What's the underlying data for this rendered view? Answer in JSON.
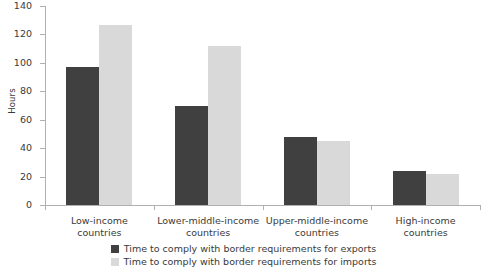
{
  "chart_data": {
    "type": "bar",
    "title": "",
    "xlabel": "",
    "ylabel": "Hours",
    "ylim": [
      0,
      140
    ],
    "ytick_step": 20,
    "grid": false,
    "legend_position": "bottom-center",
    "categories": [
      "Low-income countries",
      "Lower-middle-income countries",
      "Upper-middle-income countries",
      "High-income countries"
    ],
    "category_lines": [
      [
        "Low-income",
        "countries"
      ],
      [
        "Lower-middle-income",
        "countries"
      ],
      [
        "Upper-middle-income",
        "countries"
      ],
      [
        "High-income",
        "countries"
      ]
    ],
    "ytick_labels": [
      "140",
      "120",
      "100",
      "80",
      "60",
      "40",
      "20",
      "0"
    ],
    "ytick_values": [
      140,
      120,
      100,
      80,
      60,
      40,
      20,
      0
    ],
    "series": [
      {
        "name": "Time to comply with border requirements for exports",
        "color": "#404040",
        "values": [
          97,
          69.5,
          48,
          24
        ]
      },
      {
        "name": "Time to comply with border requirements for imports",
        "color": "#d9d9d9",
        "values": [
          126.5,
          112,
          45,
          22
        ]
      }
    ]
  },
  "legend": {
    "items": [
      {
        "label": "Time to comply with border requirements for exports",
        "color": "#404040"
      },
      {
        "label": "Time to comply with border requirements for imports",
        "color": "#d9d9d9"
      }
    ]
  },
  "axis": {
    "y_title": "Hours"
  }
}
